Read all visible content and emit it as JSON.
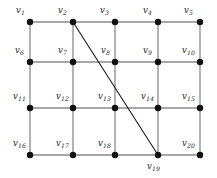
{
  "figure": {
    "background_color": "#ffffff",
    "node_color": "#111111",
    "grid_edge_color": "#8a8a8a",
    "diagonal_edge_color": "#1a1a1a",
    "label_prefix": "v"
  },
  "chart_data": {
    "type": "diagram",
    "graph_type": "grid-graph",
    "rows": 4,
    "cols": 5,
    "node_count": 20,
    "edge_count": 32
  },
  "nodes": [
    {
      "id": "v1",
      "name": "v",
      "sub": "1",
      "x": 30,
      "y": 22,
      "label_x": 16,
      "label_y": 6,
      "row": 0,
      "col": 0
    },
    {
      "id": "v2",
      "name": "v",
      "sub": "2",
      "x": 73,
      "y": 22,
      "label_x": 58,
      "label_y": 6,
      "row": 0,
      "col": 1
    },
    {
      "id": "v3",
      "name": "v",
      "sub": "3",
      "x": 115,
      "y": 22,
      "label_x": 100,
      "label_y": 6,
      "row": 0,
      "col": 2
    },
    {
      "id": "v4",
      "name": "v",
      "sub": "4",
      "x": 158,
      "y": 22,
      "label_x": 143,
      "label_y": 6,
      "row": 0,
      "col": 3
    },
    {
      "id": "v5",
      "name": "v",
      "sub": "5",
      "x": 200,
      "y": 22,
      "label_x": 184,
      "label_y": 6,
      "row": 0,
      "col": 4
    },
    {
      "id": "v6",
      "name": "v",
      "sub": "6",
      "x": 30,
      "y": 62,
      "label_x": 15,
      "label_y": 46,
      "row": 1,
      "col": 0
    },
    {
      "id": "v7",
      "name": "v",
      "sub": "7",
      "x": 73,
      "y": 62,
      "label_x": 58,
      "label_y": 46,
      "row": 1,
      "col": 1
    },
    {
      "id": "v8",
      "name": "v",
      "sub": "8",
      "x": 115,
      "y": 62,
      "label_x": 101,
      "label_y": 46,
      "row": 1,
      "col": 2
    },
    {
      "id": "v9",
      "name": "v",
      "sub": "9",
      "x": 158,
      "y": 62,
      "label_x": 143,
      "label_y": 46,
      "row": 1,
      "col": 3
    },
    {
      "id": "v10",
      "name": "v",
      "sub": "10",
      "x": 200,
      "y": 62,
      "label_x": 182,
      "label_y": 46,
      "row": 1,
      "col": 4
    },
    {
      "id": "v11",
      "name": "v",
      "sub": "11",
      "x": 30,
      "y": 108,
      "label_x": 13,
      "label_y": 92,
      "row": 2,
      "col": 0
    },
    {
      "id": "v12",
      "name": "v",
      "sub": "12",
      "x": 73,
      "y": 108,
      "label_x": 56,
      "label_y": 92,
      "row": 2,
      "col": 1
    },
    {
      "id": "v13",
      "name": "v",
      "sub": "13",
      "x": 115,
      "y": 108,
      "label_x": 98,
      "label_y": 92,
      "row": 2,
      "col": 2
    },
    {
      "id": "v14",
      "name": "v",
      "sub": "14",
      "x": 158,
      "y": 108,
      "label_x": 141,
      "label_y": 92,
      "row": 2,
      "col": 3
    },
    {
      "id": "v15",
      "name": "v",
      "sub": "15",
      "x": 200,
      "y": 108,
      "label_x": 182,
      "label_y": 92,
      "row": 2,
      "col": 4
    },
    {
      "id": "v16",
      "name": "v",
      "sub": "16",
      "x": 30,
      "y": 155,
      "label_x": 13,
      "label_y": 139,
      "row": 3,
      "col": 0
    },
    {
      "id": "v17",
      "name": "v",
      "sub": "17",
      "x": 73,
      "y": 155,
      "label_x": 56,
      "label_y": 139,
      "row": 3,
      "col": 1
    },
    {
      "id": "v18",
      "name": "v",
      "sub": "18",
      "x": 115,
      "y": 155,
      "label_x": 98,
      "label_y": 139,
      "row": 3,
      "col": 2
    },
    {
      "id": "v19",
      "name": "v",
      "sub": "19",
      "x": 158,
      "y": 155,
      "label_x": 147,
      "label_y": 162,
      "row": 3,
      "col": 3
    },
    {
      "id": "v20",
      "name": "v",
      "sub": "20",
      "x": 200,
      "y": 155,
      "label_x": 182,
      "label_y": 139,
      "row": 3,
      "col": 4
    }
  ],
  "edges": [
    {
      "from": "v1",
      "to": "v2",
      "kind": "grid"
    },
    {
      "from": "v2",
      "to": "v3",
      "kind": "grid"
    },
    {
      "from": "v3",
      "to": "v4",
      "kind": "grid"
    },
    {
      "from": "v4",
      "to": "v5",
      "kind": "grid"
    },
    {
      "from": "v6",
      "to": "v7",
      "kind": "grid"
    },
    {
      "from": "v7",
      "to": "v8",
      "kind": "grid"
    },
    {
      "from": "v8",
      "to": "v9",
      "kind": "grid"
    },
    {
      "from": "v9",
      "to": "v10",
      "kind": "grid"
    },
    {
      "from": "v11",
      "to": "v12",
      "kind": "grid"
    },
    {
      "from": "v12",
      "to": "v13",
      "kind": "grid"
    },
    {
      "from": "v13",
      "to": "v14",
      "kind": "grid"
    },
    {
      "from": "v14",
      "to": "v15",
      "kind": "grid"
    },
    {
      "from": "v16",
      "to": "v17",
      "kind": "grid"
    },
    {
      "from": "v17",
      "to": "v18",
      "kind": "grid"
    },
    {
      "from": "v18",
      "to": "v19",
      "kind": "grid"
    },
    {
      "from": "v19",
      "to": "v20",
      "kind": "grid"
    },
    {
      "from": "v1",
      "to": "v6",
      "kind": "grid"
    },
    {
      "from": "v6",
      "to": "v11",
      "kind": "grid"
    },
    {
      "from": "v11",
      "to": "v16",
      "kind": "grid"
    },
    {
      "from": "v2",
      "to": "v7",
      "kind": "grid"
    },
    {
      "from": "v7",
      "to": "v12",
      "kind": "grid"
    },
    {
      "from": "v12",
      "to": "v17",
      "kind": "grid"
    },
    {
      "from": "v3",
      "to": "v8",
      "kind": "grid"
    },
    {
      "from": "v8",
      "to": "v13",
      "kind": "grid"
    },
    {
      "from": "v13",
      "to": "v18",
      "kind": "grid"
    },
    {
      "from": "v4",
      "to": "v9",
      "kind": "grid"
    },
    {
      "from": "v9",
      "to": "v14",
      "kind": "grid"
    },
    {
      "from": "v14",
      "to": "v19",
      "kind": "grid"
    },
    {
      "from": "v5",
      "to": "v10",
      "kind": "grid"
    },
    {
      "from": "v10",
      "to": "v15",
      "kind": "grid"
    },
    {
      "from": "v15",
      "to": "v20",
      "kind": "grid"
    },
    {
      "from": "v2",
      "to": "v19",
      "kind": "diagonal"
    }
  ]
}
